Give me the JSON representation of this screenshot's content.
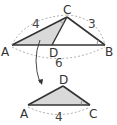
{
  "figure": {
    "top_triangle": {
      "vertices": {
        "A": "A",
        "B": "B",
        "C": "C",
        "D": "D"
      },
      "side_labels": {
        "AC": "4",
        "CB": "3",
        "AB": "6"
      }
    },
    "bottom_triangle": {
      "vertices": {
        "A": "A",
        "D": "D",
        "C": "C"
      },
      "side_labels": {
        "AC": "4"
      }
    },
    "colors": {
      "line": "#333333",
      "fill": "#d9d9d9",
      "dashed": "#999999"
    }
  }
}
